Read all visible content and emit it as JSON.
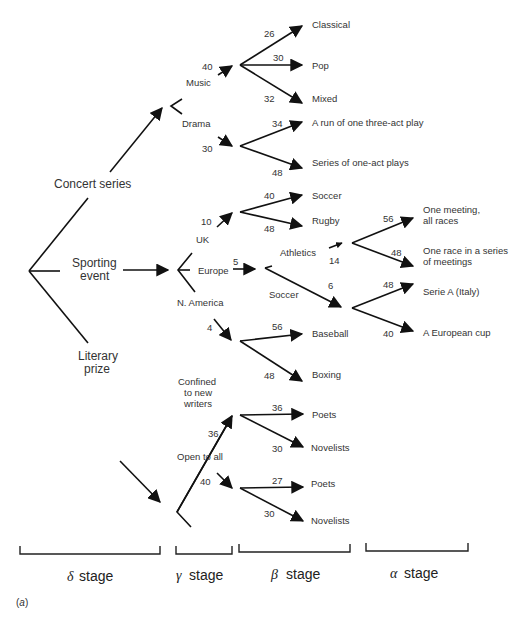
{
  "figure": {
    "caption": "(a)",
    "caption_letter": "a"
  },
  "delta": {
    "concert": "Concert series",
    "sport_line1": "Sporting",
    "sport_line2": "event",
    "literary_line1": "Literary",
    "literary_line2": "prize"
  },
  "gamma": {
    "music": "Music",
    "music_value": "40",
    "drama": "Drama",
    "drama_value": "30",
    "uk": "UK",
    "uk_value": "10",
    "europe": "Europe",
    "europe_value": "5",
    "namerica": "N. America",
    "namerica_value": "4",
    "confined_line1": "Confined",
    "confined_line2": "to new",
    "confined_line3": "writers",
    "confined_value": "36",
    "open": "Open to all",
    "open_value": "40"
  },
  "beta": {
    "classical": "Classical",
    "classical_value": "26",
    "pop": "Pop",
    "pop_value": "30",
    "mixed": "Mixed",
    "mixed_value": "32",
    "threeact": "A run of one three-act play",
    "threeact_value": "34",
    "oneact": "Series of one-act plays",
    "oneact_value": "48",
    "uk_soccer": "Soccer",
    "uk_soccer_value": "40",
    "rugby": "Rugby",
    "rugby_value": "48",
    "athletics": "Athletics",
    "athletics_value": "14",
    "eu_soccer": "Soccer",
    "eu_soccer_value": "6",
    "baseball": "Baseball",
    "baseball_value": "56",
    "boxing": "Boxing",
    "boxing_value": "48",
    "new_poets": "Poets",
    "new_poets_value": "36",
    "new_novelists": "Novelists",
    "new_novelists_value": "30",
    "open_poets": "Poets",
    "open_poets_value": "27",
    "open_novelists": "Novelists",
    "open_novelists_value": "30"
  },
  "alpha": {
    "one_meeting_line1": "One meeting,",
    "one_meeting_line2": "all races",
    "one_meeting_value": "56",
    "one_race_line1": "One race in a series",
    "one_race_line2": "of meetings",
    "one_race_value": "48",
    "serie_a": "Serie A (Italy)",
    "serie_a_value": "48",
    "euro_cup": "A European cup",
    "euro_cup_value": "40"
  },
  "stages": [
    {
      "symbol": "δ",
      "label": "stage"
    },
    {
      "symbol": "γ",
      "label": "stage"
    },
    {
      "symbol": "β",
      "label": "stage"
    },
    {
      "symbol": "α",
      "label": "stage"
    }
  ]
}
